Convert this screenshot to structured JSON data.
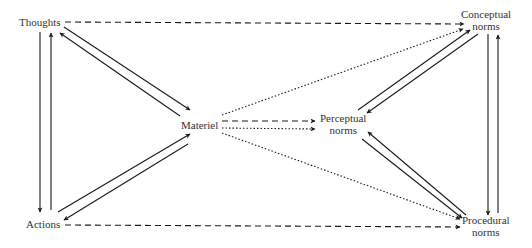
{
  "nodes": {
    "thoughts": {
      "label": "Thoughts"
    },
    "actions": {
      "label": "Actions"
    },
    "materiel": {
      "label": "Materiel"
    },
    "conceptual": {
      "line1": "Conceptual",
      "line2": "norms"
    },
    "perceptual": {
      "line1": "Perceptual",
      "line2": "norms"
    },
    "procedural": {
      "line1": "Procedural",
      "line2": "norms"
    }
  },
  "edges": [
    {
      "from": "Thoughts",
      "to": "Actions",
      "style": "solid"
    },
    {
      "from": "Actions",
      "to": "Thoughts",
      "style": "solid"
    },
    {
      "from": "Thoughts",
      "to": "Materiel",
      "style": "solid"
    },
    {
      "from": "Materiel",
      "to": "Thoughts",
      "style": "solid"
    },
    {
      "from": "Actions",
      "to": "Materiel",
      "style": "solid"
    },
    {
      "from": "Materiel",
      "to": "Actions",
      "style": "solid"
    },
    {
      "from": "Thoughts",
      "to": "Conceptual norms",
      "style": "dashed"
    },
    {
      "from": "Actions",
      "to": "Procedural norms",
      "style": "dashed"
    },
    {
      "from": "Materiel",
      "to": "Perceptual norms",
      "style": "dashed"
    },
    {
      "from": "Materiel",
      "to": "Perceptual norms",
      "style": "dotted"
    },
    {
      "from": "Materiel",
      "to": "Conceptual norms",
      "style": "dotted"
    },
    {
      "from": "Materiel",
      "to": "Procedural norms",
      "style": "dotted"
    },
    {
      "from": "Perceptual norms",
      "to": "Conceptual norms",
      "style": "solid"
    },
    {
      "from": "Conceptual norms",
      "to": "Perceptual norms",
      "style": "solid"
    },
    {
      "from": "Procedural norms",
      "to": "Perceptual norms",
      "style": "solid"
    },
    {
      "from": "Perceptual norms",
      "to": "Procedural norms",
      "style": "solid"
    },
    {
      "from": "Conceptual norms",
      "to": "Procedural norms",
      "style": "solid"
    },
    {
      "from": "Procedural norms",
      "to": "Conceptual norms",
      "style": "solid"
    }
  ],
  "colors": {
    "line": "#1a1a1a",
    "text": "#333333",
    "background": "#ffffff"
  }
}
